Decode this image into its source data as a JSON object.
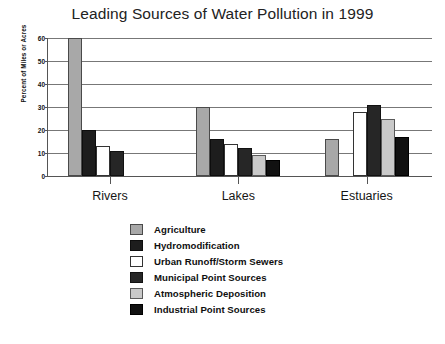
{
  "chart_data": {
    "type": "bar",
    "title": "Leading Sources of Water Pollution in 1999",
    "xlabel": "",
    "ylabel": "Percent of Miles or Acres",
    "categories": [
      "Rivers",
      "Lakes",
      "Estuaries"
    ],
    "ylim": [
      0,
      60
    ],
    "yticks": [
      0,
      10,
      20,
      30,
      40,
      50,
      60
    ],
    "grid": true,
    "legend_position": "bottom",
    "series": [
      {
        "name": "Agriculture",
        "color": "#a8a8a8",
        "values": [
          60,
          30,
          16
        ]
      },
      {
        "name": "Hydromodification",
        "color": "#1d1d1d",
        "values": [
          20,
          16,
          0
        ]
      },
      {
        "name": "Urban Runoff/Storm Sewers",
        "color": "#ffffff",
        "values": [
          13,
          14,
          28
        ]
      },
      {
        "name": "Municipal Point Sources",
        "color": "#262626",
        "values": [
          11,
          12,
          31
        ]
      },
      {
        "name": "Atmospheric Deposition",
        "color": "#c9c9c9",
        "values": [
          0,
          9,
          25
        ]
      },
      {
        "name": "Industrial Point Sources",
        "color": "#111111",
        "values": [
          0,
          7,
          17
        ]
      }
    ]
  },
  "yticks_text": [
    "60",
    "50",
    "40",
    "30",
    "20",
    "10",
    "0"
  ]
}
